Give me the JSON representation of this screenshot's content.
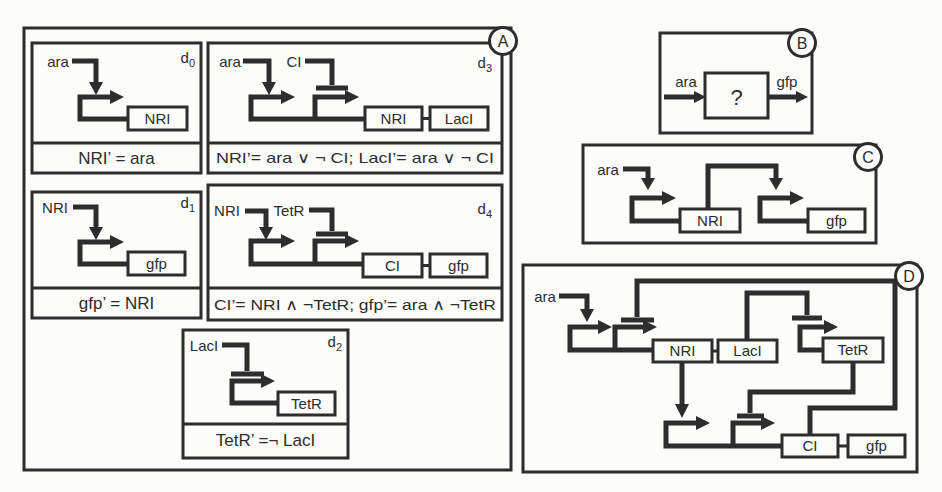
{
  "colors": {
    "ink": "#2d2d2d",
    "background": "#fcfcfb"
  },
  "panel_a": {
    "label": "A",
    "modules": [
      {
        "name": "d",
        "sub": "0",
        "inputs": [
          "ara"
        ],
        "genes": [
          "NRI"
        ],
        "formula": "NRI’ = ara"
      },
      {
        "name": "d",
        "sub": "3",
        "inputs": [
          "ara",
          "CI"
        ],
        "genes": [
          "NRI",
          "LacI"
        ],
        "formula": "NRI’= ara ∨ ¬ CI; LacI’= ara ∨ ¬ CI"
      },
      {
        "name": "d",
        "sub": "1",
        "inputs": [
          "NRI"
        ],
        "genes": [
          "gfp"
        ],
        "formula": "gfp’ = NRI"
      },
      {
        "name": "d",
        "sub": "4",
        "inputs": [
          "NRI",
          "TetR"
        ],
        "genes": [
          "CI",
          "gfp"
        ],
        "formula": "CI’= NRI ∧ ¬TetR; gfp’= ara ∧ ¬TetR"
      },
      {
        "name": "d",
        "sub": "2",
        "inputs": [
          "LacI"
        ],
        "genes": [
          "TetR"
        ],
        "formula": "TetR’ =¬ LacI"
      }
    ]
  },
  "panel_b": {
    "label": "B",
    "input": "ara",
    "unknown": "?",
    "output": "gfp"
  },
  "panel_c": {
    "label": "C",
    "input": "ara",
    "genes": [
      "NRI",
      "gfp"
    ]
  },
  "panel_d": {
    "label": "D",
    "input": "ara",
    "genes": [
      "NRI",
      "LacI",
      "TetR",
      "CI",
      "gfp"
    ]
  }
}
